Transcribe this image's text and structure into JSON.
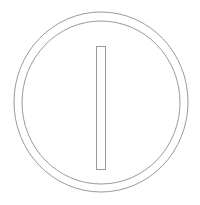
{
  "icon": {
    "name": "power-on-switch-icon",
    "label": "On",
    "colors": {
      "background": "#ffffff",
      "stroke": "#9a9a9a"
    },
    "outer_ring": {
      "cx": "101",
      "cy": "102",
      "rx": "87",
      "ry": "90"
    },
    "inner_ring": {
      "cx": "101",
      "cy": "102.5",
      "rx": "79",
      "ry": "81.5"
    },
    "bar": {
      "x": "96",
      "y": "46",
      "width": "9",
      "height": "123"
    }
  }
}
